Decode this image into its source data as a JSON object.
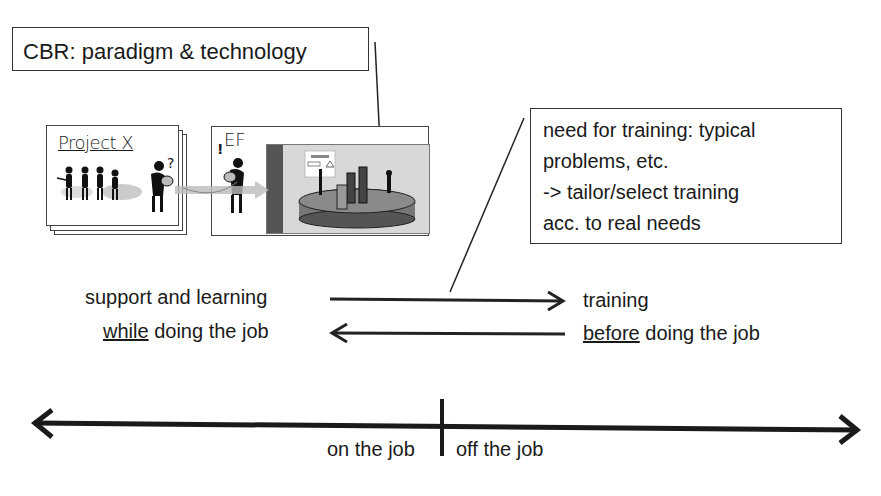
{
  "cbr_box": {
    "text": "CBR: paradigm & technology"
  },
  "need_box": {
    "lines": [
      "need for training: typical",
      "problems, etc.",
      "-> tailor/select training",
      "acc. to real needs"
    ]
  },
  "illustration": {
    "project_card_title": "Project X",
    "ef_card_title": "EF",
    "ef_exclaim": "!",
    "project_question": "?"
  },
  "middle": {
    "left_line1": "support and learning",
    "left_line2_ul": "while",
    "left_line2_rest": " doing the job",
    "right_line1": "training",
    "right_line2_ul": "before",
    "right_line2_rest": " doing the job"
  },
  "axis": {
    "left_label": "on the job",
    "right_label": "off the job"
  },
  "colors": {
    "ink": "#1a1a1a",
    "panel_gray": "#d8d8d8",
    "dark_gray": "#555555"
  }
}
